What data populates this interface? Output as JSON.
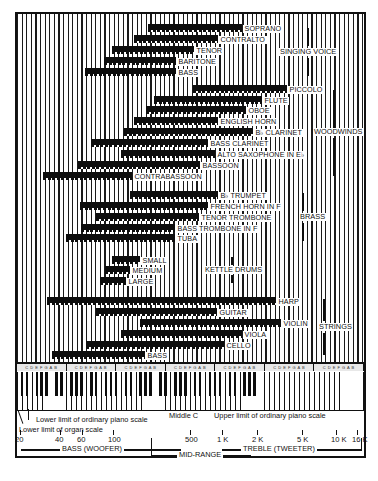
{
  "figure": {
    "groups": {
      "singing": "SINGING VOICE",
      "woodwinds": "WOODWINDS",
      "brass": "BRASS",
      "kettle": "KETTLE DRUMS",
      "strings": "STRINGS"
    },
    "bars": [
      {
        "label": "SOPRANO",
        "x1": 148,
        "x2": 242,
        "y": 24
      },
      {
        "label": "CONTRALTO",
        "x1": 134,
        "x2": 218,
        "y": 35
      },
      {
        "label": "TENOR",
        "x1": 112,
        "x2": 194,
        "y": 46
      },
      {
        "label": "BARITONE",
        "x1": 104,
        "x2": 176,
        "y": 57
      },
      {
        "label": "BASS",
        "x1": 85,
        "x2": 176,
        "y": 68
      },
      {
        "label": "PICCOLO",
        "x1": 193,
        "x2": 287,
        "y": 85
      },
      {
        "label": "FLUTE",
        "x1": 154,
        "x2": 262,
        "y": 96
      },
      {
        "label": "OBOE",
        "x1": 146,
        "x2": 246,
        "y": 106
      },
      {
        "label": "ENGLISH HORN",
        "x1": 134,
        "x2": 218,
        "y": 117
      },
      {
        "label": "B♭ CLARINET",
        "x1": 124,
        "x2": 253,
        "y": 128
      },
      {
        "label": "BASS CLARINET",
        "x1": 91,
        "x2": 208,
        "y": 139
      },
      {
        "label": "ALTO SAXOPHONE IN E♭",
        "x1": 121,
        "x2": 215,
        "y": 150
      },
      {
        "label": "BASSOON",
        "x1": 78,
        "x2": 200,
        "y": 161
      },
      {
        "label": "CONTRABASSOON",
        "x1": 43,
        "x2": 132,
        "y": 172
      },
      {
        "label": "B♭  TRUMPET",
        "x1": 130,
        "x2": 218,
        "y": 191
      },
      {
        "label": "FRENCH HORN IN F",
        "x1": 80,
        "x2": 208,
        "y": 202
      },
      {
        "label": "TENOR TROMBONE",
        "x1": 96,
        "x2": 199,
        "y": 213
      },
      {
        "label": "BASS TROMBONE IN F",
        "x1": 81,
        "x2": 175,
        "y": 224
      },
      {
        "label": "TUBA",
        "x1": 66,
        "x2": 175,
        "y": 234
      },
      {
        "label": "SMALL",
        "x1": 112,
        "x2": 140,
        "y": 256
      },
      {
        "label": "MEDIUM",
        "x1": 105,
        "x2": 130,
        "y": 266
      },
      {
        "label": "LARGE",
        "x1": 100,
        "x2": 126,
        "y": 277
      },
      {
        "label": "HARP",
        "x1": 47,
        "x2": 276,
        "y": 297
      },
      {
        "label": "GUITAR",
        "x1": 96,
        "x2": 217,
        "y": 308
      },
      {
        "label": "VIOLIN",
        "x1": 140,
        "x2": 281,
        "y": 319
      },
      {
        "label": "VIOLA",
        "x1": 121,
        "x2": 242,
        "y": 330
      },
      {
        "label": "CELLO",
        "x1": 86,
        "x2": 224,
        "y": 341
      },
      {
        "label": "BASS",
        "x1": 52,
        "x2": 145,
        "y": 351
      }
    ],
    "keyboard": {
      "octave_label": "C D E F G A B",
      "octave_count": 7
    },
    "annotations": {
      "lower_piano": "Lower limit of ordinary piano scale",
      "lower_organ": "Lower limit of organ scale",
      "middle_c": "Middle C",
      "upper_piano": "Upper limit of ordinary piano scale"
    },
    "frequency_ticks": [
      {
        "label": "20",
        "x": 20
      },
      {
        "label": "40",
        "x": 60
      },
      {
        "label": "60",
        "x": 82
      },
      {
        "label": "100",
        "x": 113
      },
      {
        "label": "500",
        "x": 190
      },
      {
        "label": "1 K",
        "x": 222
      },
      {
        "label": "2 K",
        "x": 257
      },
      {
        "label": "5 K",
        "x": 302
      },
      {
        "label": "10 K",
        "x": 336
      },
      {
        "label": "16 K",
        "x": 357
      }
    ],
    "ranges": {
      "bass": "BASS (WOOFER)",
      "mid": "MID-RANGE",
      "treble": "TREBLE (TWEETER)"
    }
  }
}
